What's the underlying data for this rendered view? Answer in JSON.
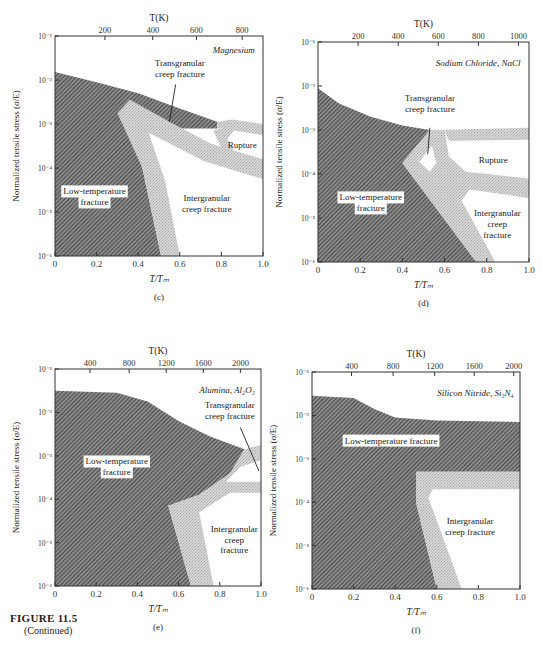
{
  "figure": {
    "title": "FIGURE 11.5",
    "subtitle": "(Continued)"
  },
  "colors": {
    "axis": "#333333",
    "hatch": "#555555",
    "transition": "#cfcfcf",
    "background": "#ffffff"
  },
  "chart_data": [
    {
      "type": "area",
      "panel": "(c)",
      "title": "Magnesium",
      "xlabel": "T/T_m",
      "x2label": "T(K)",
      "ylabel": "Normalized tensile stress (σ/E)",
      "xlim": [
        0,
        1.0
      ],
      "ylim_log10": [
        -6,
        -1
      ],
      "xticks": [
        "0",
        "0.2",
        "0.4",
        "0.6",
        "0.8",
        "1.0"
      ],
      "yticks": [
        "10^-6",
        "10^-5",
        "10^-4",
        "10^-3",
        "10^-2",
        "10^-1"
      ],
      "top_ticks": [
        {
          "label": "200",
          "x": 0.24
        },
        {
          "label": "400",
          "x": 0.47
        },
        {
          "label": "600",
          "x": 0.68
        },
        {
          "label": "800",
          "x": 0.9
        }
      ],
      "box": {
        "x": 55,
        "y": 36,
        "w": 208,
        "h": 220
      },
      "regions": [
        {
          "name": "Low-temperature fracture",
          "style": "hatch",
          "points": [
            [
              0,
              -1.82
            ],
            [
              0.2,
              -2.05
            ],
            [
              0.4,
              -2.3
            ],
            [
              0.6,
              -2.65
            ],
            [
              0.78,
              -2.95
            ],
            [
              0.78,
              -3.1
            ],
            [
              0.55,
              -3.1
            ],
            [
              0.35,
              -2.9
            ],
            [
              0.42,
              -4.0
            ],
            [
              0.51,
              -6
            ],
            [
              0,
              -6
            ]
          ]
        },
        {
          "name": "Transition band (Mg) lower",
          "style": "transition",
          "points": [
            [
              0.3,
              -2.75
            ],
            [
              0.36,
              -2.45
            ],
            [
              0.55,
              -2.95
            ],
            [
              0.75,
              -3.45
            ],
            [
              1.0,
              -3.8
            ],
            [
              1.0,
              -4.25
            ],
            [
              0.72,
              -3.85
            ],
            [
              0.45,
              -3.2
            ],
            [
              0.53,
              -4.3
            ],
            [
              0.6,
              -6
            ],
            [
              0.51,
              -6
            ],
            [
              0.42,
              -4.0
            ]
          ]
        },
        {
          "name": "Transition band (Mg) upper",
          "style": "transition",
          "points": [
            [
              0.78,
              -2.95
            ],
            [
              0.85,
              -2.9
            ],
            [
              1.0,
              -3.0
            ],
            [
              1.0,
              -3.25
            ],
            [
              0.86,
              -3.15
            ],
            [
              0.82,
              -3.4
            ],
            [
              0.8,
              -3.1
            ],
            [
              0.78,
              -3.1
            ]
          ]
        },
        {
          "name": "Transition band (Mg) diagonal",
          "style": "transition",
          "points": [
            [
              0.76,
              -3.15
            ],
            [
              0.8,
              -3.1
            ],
            [
              0.87,
              -3.7
            ],
            [
              0.82,
              -3.75
            ]
          ]
        }
      ],
      "labels": [
        {
          "text": "Magnesium",
          "x": 0.96,
          "y": -1.38,
          "anchor": "end",
          "italic": true
        },
        {
          "text": "Transgranular",
          "x": 0.6,
          "y": -1.68,
          "anchor": "middle"
        },
        {
          "text": "creep fracture",
          "x": 0.6,
          "y": -1.93,
          "anchor": "middle"
        },
        {
          "text": "Rupture",
          "x": 0.9,
          "y": -3.55,
          "anchor": "middle"
        },
        {
          "text": "Low-temperature",
          "x": 0.19,
          "y": -4.6,
          "anchor": "middle",
          "boxed": true
        },
        {
          "text": "fracture",
          "x": 0.19,
          "y": -4.85,
          "anchor": "middle",
          "boxed": true
        },
        {
          "text": "Intergranular",
          "x": 0.73,
          "y": -4.75,
          "anchor": "middle"
        },
        {
          "text": "creep fracture",
          "x": 0.73,
          "y": -5.0,
          "anchor": "middle"
        }
      ],
      "leaders": [
        [
          [
            0.58,
            -2.1
          ],
          [
            0.55,
            -2.95
          ]
        ]
      ]
    },
    {
      "type": "area",
      "panel": "(d)",
      "title": "Sodium Chloride, NaCl",
      "xlabel": "T/T_m",
      "x2label": "T(K)",
      "ylabel": "Normalized tensile stress (σ/E)",
      "xlim": [
        0,
        1.0
      ],
      "ylim_log10": [
        -6,
        -1
      ],
      "xticks": [
        "0",
        "0.2",
        "0.4",
        "0.6",
        "0.8",
        "1.0"
      ],
      "yticks": [
        "10^-6",
        "10^-5",
        "10^-4",
        "10^-3",
        "10^-2",
        "10^-1"
      ],
      "top_ticks": [
        {
          "label": "200",
          "x": 0.19
        },
        {
          "label": "400",
          "x": 0.38
        },
        {
          "label": "600",
          "x": 0.57
        },
        {
          "label": "800",
          "x": 0.76
        },
        {
          "label": "1000",
          "x": 0.95
        }
      ],
      "box": {
        "x": 318,
        "y": 42,
        "w": 211,
        "h": 220
      },
      "regions": [
        {
          "name": "Low-temperature fracture",
          "style": "hatch",
          "points": [
            [
              0,
              -2.05
            ],
            [
              0.1,
              -2.4
            ],
            [
              0.25,
              -2.7
            ],
            [
              0.4,
              -2.9
            ],
            [
              0.53,
              -3.0
            ],
            [
              0.4,
              -3.75
            ],
            [
              0.75,
              -6
            ],
            [
              0,
              -6
            ]
          ]
        },
        {
          "name": "Transition band (NaCl) main",
          "style": "transition",
          "points": [
            [
              0.4,
              -3.75
            ],
            [
              0.53,
              -3.0
            ],
            [
              0.6,
              -3.0
            ],
            [
              0.62,
              -3.6
            ],
            [
              0.7,
              -3.95
            ],
            [
              1.0,
              -4.1
            ],
            [
              1.0,
              -4.55
            ],
            [
              0.72,
              -4.35
            ],
            [
              0.68,
              -4.6
            ],
            [
              0.84,
              -6
            ],
            [
              0.75,
              -6
            ]
          ]
        },
        {
          "name": "Transition band (NaCl) top",
          "style": "transition",
          "points": [
            [
              0.53,
              -3.0
            ],
            [
              1.0,
              -2.95
            ],
            [
              1.0,
              -3.22
            ],
            [
              0.62,
              -3.25
            ],
            [
              0.6,
              -3.0
            ]
          ]
        },
        {
          "name": "Transition band (NaCl) inner",
          "style": "transition",
          "points": [
            [
              0.45,
              -3.75
            ],
            [
              0.55,
              -3.2
            ],
            [
              0.6,
              -3.7
            ],
            [
              0.55,
              -4.1
            ]
          ]
        }
      ],
      "holes": [
        [
          [
            0.48,
            -3.72
          ],
          [
            0.54,
            -3.35
          ],
          [
            0.56,
            -3.75
          ],
          [
            0.53,
            -3.95
          ]
        ]
      ],
      "labels": [
        {
          "text": "Sodium Chloride, NaCl",
          "x": 0.96,
          "y": -1.55,
          "anchor": "end",
          "italic": true
        },
        {
          "text": "Transgranular",
          "x": 0.53,
          "y": -2.35,
          "anchor": "middle"
        },
        {
          "text": "creep fracture",
          "x": 0.53,
          "y": -2.6,
          "anchor": "middle"
        },
        {
          "text": "Rupture",
          "x": 0.83,
          "y": -3.75,
          "anchor": "middle"
        },
        {
          "text": "Low-temperature",
          "x": 0.25,
          "y": -4.6,
          "anchor": "middle",
          "boxed": true
        },
        {
          "text": "fracture",
          "x": 0.25,
          "y": -4.85,
          "anchor": "middle",
          "boxed": true
        },
        {
          "text": "Intergranular",
          "x": 0.85,
          "y": -4.95,
          "anchor": "middle"
        },
        {
          "text": "creep",
          "x": 0.85,
          "y": -5.2,
          "anchor": "middle"
        },
        {
          "text": "fracture",
          "x": 0.85,
          "y": -5.45,
          "anchor": "middle"
        }
      ],
      "leaders": [
        [
          [
            0.53,
            -2.95
          ],
          [
            0.52,
            -3.55
          ]
        ]
      ]
    },
    {
      "type": "area",
      "panel": "(e)",
      "title": "Alumina, Al2O3",
      "xlabel": "T/T_m",
      "x2label": "T(K)",
      "ylabel": "Normalized tensile stress (σ/E)",
      "xlim": [
        0,
        1.0
      ],
      "ylim_log10": [
        -6,
        -1
      ],
      "xticks": [
        "0",
        "0.2",
        "0.4",
        "0.6",
        "0.8",
        "1.0"
      ],
      "yticks": [
        "10^-6",
        "10^-5",
        "10^-4",
        "10^-3",
        "10^-2",
        "10^-1"
      ],
      "top_ticks": [
        {
          "label": "400",
          "x": 0.17
        },
        {
          "label": "800",
          "x": 0.36
        },
        {
          "label": "1200",
          "x": 0.54
        },
        {
          "label": "1600",
          "x": 0.72
        },
        {
          "label": "2000",
          "x": 0.9
        }
      ],
      "box": {
        "x": 55,
        "y": 369,
        "w": 206,
        "h": 217
      },
      "regions": [
        {
          "name": "Low-temperature fracture",
          "style": "hatch",
          "points": [
            [
              0,
              -1.5
            ],
            [
              0.3,
              -1.55
            ],
            [
              0.45,
              -1.75
            ],
            [
              0.6,
              -2.2
            ],
            [
              0.75,
              -2.55
            ],
            [
              0.92,
              -2.85
            ],
            [
              0.85,
              -3.4
            ],
            [
              0.7,
              -3.9
            ],
            [
              0.55,
              -4.15
            ],
            [
              0.66,
              -6
            ],
            [
              0,
              -6
            ]
          ]
        },
        {
          "name": "Transition band (Al2O3)",
          "style": "transition",
          "points": [
            [
              0.92,
              -2.85
            ],
            [
              1.0,
              -2.75
            ],
            [
              1.0,
              -3.1
            ],
            [
              0.9,
              -3.25
            ],
            [
              0.83,
              -3.6
            ],
            [
              1.0,
              -3.6
            ],
            [
              1.0,
              -3.85
            ],
            [
              0.85,
              -3.85
            ],
            [
              0.7,
              -4.3
            ],
            [
              0.77,
              -6
            ],
            [
              0.66,
              -6
            ],
            [
              0.55,
              -4.15
            ],
            [
              0.7,
              -3.9
            ],
            [
              0.85,
              -3.4
            ]
          ]
        }
      ],
      "labels": [
        {
          "text": "Alumina, Al₂O₃",
          "x": 0.97,
          "y": -1.55,
          "anchor": "end",
          "italic": true
        },
        {
          "text": "Transgranular",
          "x": 0.97,
          "y": -1.9,
          "anchor": "end"
        },
        {
          "text": "creep fracture",
          "x": 0.97,
          "y": -2.15,
          "anchor": "end"
        },
        {
          "text": "Low-temperature",
          "x": 0.3,
          "y": -3.2,
          "anchor": "middle",
          "boxed": true
        },
        {
          "text": "fracture",
          "x": 0.3,
          "y": -3.45,
          "anchor": "middle",
          "boxed": true
        },
        {
          "text": "Intergranular",
          "x": 0.87,
          "y": -4.75,
          "anchor": "middle"
        },
        {
          "text": "creep",
          "x": 0.87,
          "y": -5.0,
          "anchor": "middle"
        },
        {
          "text": "fracture",
          "x": 0.87,
          "y": -5.25,
          "anchor": "middle"
        }
      ],
      "leaders": [
        [
          [
            0.9,
            -2.35
          ],
          [
            0.99,
            -3.35
          ]
        ]
      ]
    },
    {
      "type": "area",
      "panel": "(f)",
      "title": "Silicon Nitride, Si3N4",
      "xlabel": "T/T_m",
      "x2label": "T(K)",
      "ylabel": "Normalized tensile stress (σ/E)",
      "xlim": [
        0,
        1.0
      ],
      "ylim_log10": [
        -6,
        -1
      ],
      "xticks": [
        "0",
        "0.2",
        "0.4",
        "0.6",
        "0.8",
        "1.0"
      ],
      "yticks": [
        "10^-6",
        "10^-5",
        "10^-4",
        "10^-3",
        "10^-2",
        "10^-1"
      ],
      "top_ticks": [
        {
          "label": "400",
          "x": 0.19
        },
        {
          "label": "800",
          "x": 0.39
        },
        {
          "label": "1200",
          "x": 0.59
        },
        {
          "label": "1600",
          "x": 0.78
        },
        {
          "label": "2000",
          "x": 0.97
        }
      ],
      "box": {
        "x": 312,
        "y": 372,
        "w": 208,
        "h": 217
      },
      "regions": [
        {
          "name": "Low-temperature fracture",
          "style": "hatch",
          "points": [
            [
              0,
              -1.55
            ],
            [
              0.2,
              -1.6
            ],
            [
              0.3,
              -1.85
            ],
            [
              0.4,
              -2.05
            ],
            [
              0.6,
              -2.12
            ],
            [
              1.0,
              -2.15
            ],
            [
              1.0,
              -3.3
            ],
            [
              0.5,
              -3.3
            ],
            [
              0.5,
              -4.0
            ],
            [
              0.6,
              -6
            ],
            [
              0,
              -6
            ]
          ]
        },
        {
          "name": "Transition band (Si3N4)",
          "style": "transition",
          "points": [
            [
              0.5,
              -3.3
            ],
            [
              1.0,
              -3.3
            ],
            [
              1.0,
              -3.7
            ],
            [
              0.58,
              -3.7
            ],
            [
              0.56,
              -3.9
            ],
            [
              0.72,
              -6
            ],
            [
              0.6,
              -6
            ],
            [
              0.5,
              -4.0
            ]
          ]
        }
      ],
      "labels": [
        {
          "text": "Silicon Nitride, Si₃N₄",
          "x": 0.97,
          "y": -1.55,
          "anchor": "end",
          "italic": true
        },
        {
          "text": "Low-temperature fracture",
          "x": 0.38,
          "y": -2.65,
          "anchor": "middle",
          "boxed": true
        },
        {
          "text": "Intergranular",
          "x": 0.76,
          "y": -4.5,
          "anchor": "middle"
        },
        {
          "text": "creep fracture",
          "x": 0.76,
          "y": -4.75,
          "anchor": "middle"
        }
      ],
      "leaders": []
    }
  ]
}
